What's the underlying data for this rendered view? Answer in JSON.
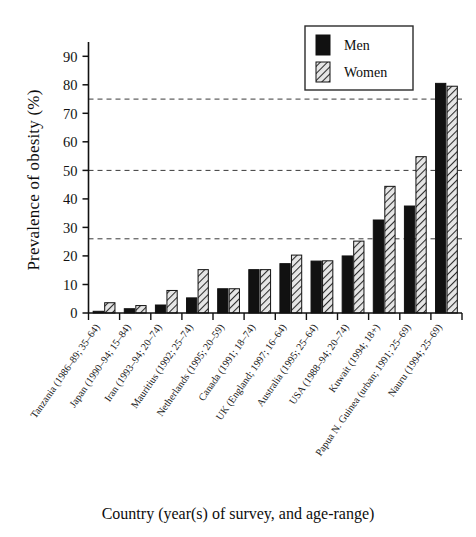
{
  "chart_data": {
    "type": "bar",
    "title": "",
    "xlabel": "Country (year(s) of survey, and age-range)",
    "ylabel": "Prevalence of obesity (%)",
    "ylim": [
      0,
      95
    ],
    "yticks": [
      0,
      10,
      20,
      30,
      40,
      50,
      60,
      70,
      80,
      90
    ],
    "grid": false,
    "reference_lines": [
      26,
      50,
      75
    ],
    "legend_position": "top-right",
    "categories": [
      "Tanzania (1986–89; 35–64)",
      "Japan (1990–94; 15–84)",
      "Iran (1993–94; 20–74)",
      "Mauritius (1992; 25–74)",
      "Netherlands (1995; 20–59)",
      "Canada (1991; 18–74)",
      "UK (England; 1997; 16–64)",
      "Australia (1995; 25–64)",
      "USA (1988–94; 20–74)",
      "Kuwait (1994; 18+)",
      "Papua N. Guinea (urban; 1991; 25–69)",
      "Nauru (1994; 25–69)"
    ],
    "series": [
      {
        "name": "Men",
        "color": "#111111",
        "pattern": "solid",
        "values": [
          0.6,
          1.5,
          2.8,
          5.3,
          8.5,
          15.2,
          17.3,
          18.2,
          20.0,
          32.6,
          37.5,
          80.5
        ]
      },
      {
        "name": "Women",
        "color": "#d8d8d8",
        "pattern": "diagonal-hatch",
        "values": [
          3.6,
          2.6,
          7.9,
          15.2,
          8.5,
          15.2,
          20.3,
          18.3,
          25.2,
          44.4,
          54.8,
          79.5
        ]
      }
    ]
  },
  "legend": {
    "entries": [
      {
        "label": "Men"
      },
      {
        "label": "Women"
      }
    ]
  },
  "axis": {
    "y_title": "Prevalence of obesity (%)",
    "x_title": "Country (year(s) of survey, and age-range)"
  }
}
